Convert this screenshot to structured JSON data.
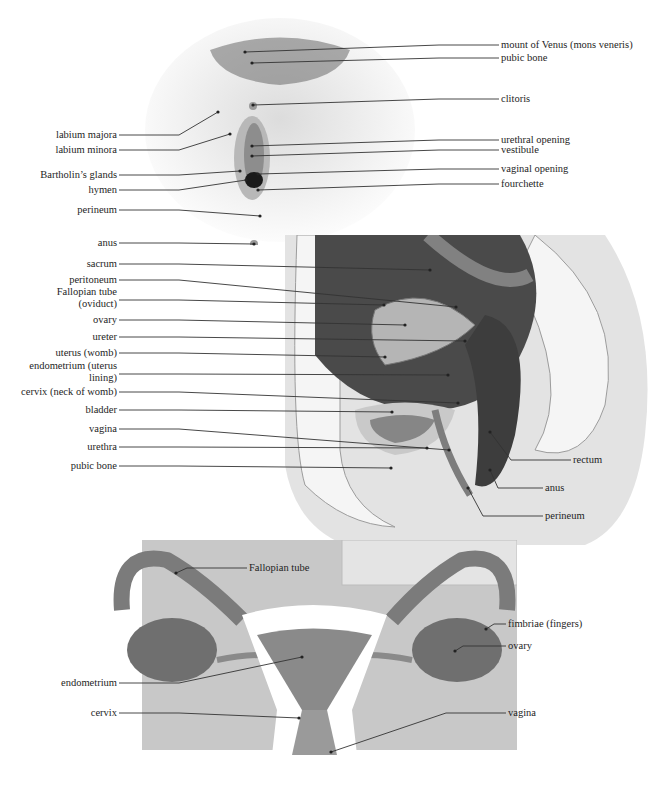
{
  "figures": {
    "external": {
      "caption": "external view",
      "labels": [
        {
          "id": "mons",
          "text": "mount of Venus (mons veneris)",
          "x": 501,
          "y": 45,
          "side": "right",
          "target": [
            245,
            52
          ]
        },
        {
          "id": "pubic_bone_ext",
          "text": "pubic bone",
          "x": 501,
          "y": 58,
          "side": "right",
          "target": [
            252,
            63
          ]
        },
        {
          "id": "clitoris",
          "text": "clitoris",
          "x": 501,
          "y": 99,
          "side": "right",
          "target": [
            253,
            105
          ]
        },
        {
          "id": "labium_majora",
          "text": "labium majora",
          "x": 117,
          "y": 135,
          "side": "left",
          "target": [
            218,
            112
          ]
        },
        {
          "id": "labium_minora",
          "text": "labium minora",
          "x": 117,
          "y": 150,
          "side": "left",
          "target": [
            230,
            134
          ]
        },
        {
          "id": "urethral_opening",
          "text": "urethral opening",
          "x": 501,
          "y": 140,
          "side": "right",
          "target": [
            252,
            146
          ]
        },
        {
          "id": "vestibule",
          "text": "vestibule",
          "x": 501,
          "y": 150,
          "side": "right",
          "target": [
            252,
            156
          ]
        },
        {
          "id": "bartholin",
          "text": "Bartholin’s glands",
          "x": 117,
          "y": 175,
          "side": "left",
          "target": [
            240,
            171
          ]
        },
        {
          "id": "vaginal_opening",
          "text": "vaginal opening",
          "x": 501,
          "y": 169,
          "side": "right",
          "target": [
            258,
            174
          ]
        },
        {
          "id": "hymen",
          "text": "hymen",
          "x": 117,
          "y": 190,
          "side": "left",
          "target": [
            246,
            180
          ]
        },
        {
          "id": "fourchette",
          "text": "fourchette",
          "x": 501,
          "y": 184,
          "side": "right",
          "target": [
            258,
            190
          ]
        },
        {
          "id": "perineum_ext",
          "text": "perineum",
          "x": 117,
          "y": 210,
          "side": "left",
          "target": [
            260,
            216
          ]
        },
        {
          "id": "anus_ext",
          "text": "anus",
          "x": 117,
          "y": 243,
          "side": "left",
          "target": [
            254,
            244
          ]
        }
      ]
    },
    "sagittal": {
      "caption": "side section",
      "labels": [
        {
          "id": "sacrum",
          "text": "sacrum",
          "x": 117,
          "y": 264,
          "side": "left",
          "target": [
            430,
            270
          ]
        },
        {
          "id": "peritoneum",
          "text": "peritoneum",
          "x": 117,
          "y": 280,
          "side": "left",
          "target": [
            456,
            307
          ]
        },
        {
          "id": "fallopian_oviduct",
          "text": "Fallopian tube (oviduct)",
          "x": 117,
          "y": 292,
          "side": "left",
          "multi": true,
          "target": [
            384,
            305
          ]
        },
        {
          "id": "ovary_sag",
          "text": "ovary",
          "x": 117,
          "y": 320,
          "side": "left",
          "target": [
            405,
            325
          ]
        },
        {
          "id": "ureter",
          "text": "ureter",
          "x": 117,
          "y": 337,
          "side": "left",
          "target": [
            465,
            341
          ]
        },
        {
          "id": "uterus",
          "text": "uterus (womb)",
          "x": 117,
          "y": 353,
          "side": "left",
          "target": [
            385,
            357
          ]
        },
        {
          "id": "endometrium_sag",
          "text": "endometrium (uterus lining)",
          "x": 117,
          "y": 366,
          "side": "left",
          "multi": true,
          "target": [
            448,
            375
          ]
        },
        {
          "id": "cervix_sag",
          "text": "cervix (neck of womb)",
          "x": 117,
          "y": 392,
          "side": "left",
          "target": [
            458,
            403
          ]
        },
        {
          "id": "bladder",
          "text": "bladder",
          "x": 117,
          "y": 410,
          "side": "left",
          "target": [
            392,
            412
          ]
        },
        {
          "id": "vagina_sag",
          "text": "vagina",
          "x": 117,
          "y": 429,
          "side": "left",
          "target": [
            449,
            450
          ]
        },
        {
          "id": "urethra",
          "text": "urethra",
          "x": 117,
          "y": 447,
          "side": "left",
          "target": [
            427,
            448
          ]
        },
        {
          "id": "pubic_bone_sag",
          "text": "pubic bone",
          "x": 117,
          "y": 466,
          "side": "left",
          "target": [
            391,
            468
          ]
        },
        {
          "id": "rectum",
          "text": "rectum",
          "x": 573,
          "y": 460,
          "side": "right",
          "target": [
            490,
            432
          ]
        },
        {
          "id": "anus_sag",
          "text": "anus",
          "x": 545,
          "y": 488,
          "side": "right",
          "target": [
            490,
            470
          ]
        },
        {
          "id": "perineum_sag",
          "text": "perineum",
          "x": 545,
          "y": 516,
          "side": "right",
          "target": [
            468,
            488
          ]
        }
      ]
    },
    "frontal": {
      "caption": "front section",
      "labels": [
        {
          "id": "fallopian_front",
          "text": "Fallopian tube",
          "x": 249,
          "y": 568,
          "side": "right",
          "target": [
            176,
            573
          ]
        },
        {
          "id": "fimbriae",
          "text": "fimbriae (fingers)",
          "x": 508,
          "y": 624,
          "side": "right",
          "target": [
            486,
            629
          ]
        },
        {
          "id": "ovary_front",
          "text": "ovary",
          "x": 508,
          "y": 646,
          "side": "right",
          "target": [
            455,
            651
          ]
        },
        {
          "id": "endometrium_front",
          "text": "endometrium",
          "x": 117,
          "y": 683,
          "side": "left",
          "target": [
            302,
            657
          ]
        },
        {
          "id": "cervix_front",
          "text": "cervix",
          "x": 117,
          "y": 713,
          "side": "left",
          "target": [
            299,
            718
          ]
        },
        {
          "id": "vagina_front",
          "text": "vagina",
          "x": 508,
          "y": 713,
          "side": "right",
          "target": [
            331,
            752
          ]
        }
      ]
    }
  },
  "colors": {
    "skin": "#e6e6e6",
    "cavity": "#4a4a4a",
    "tissue": "#a7a7a7",
    "organ": "#8a8a8a",
    "fat": "#f2f2f2",
    "frontal_bg": "#c8c8c8",
    "frontal_organ": "#7b7b7b"
  }
}
